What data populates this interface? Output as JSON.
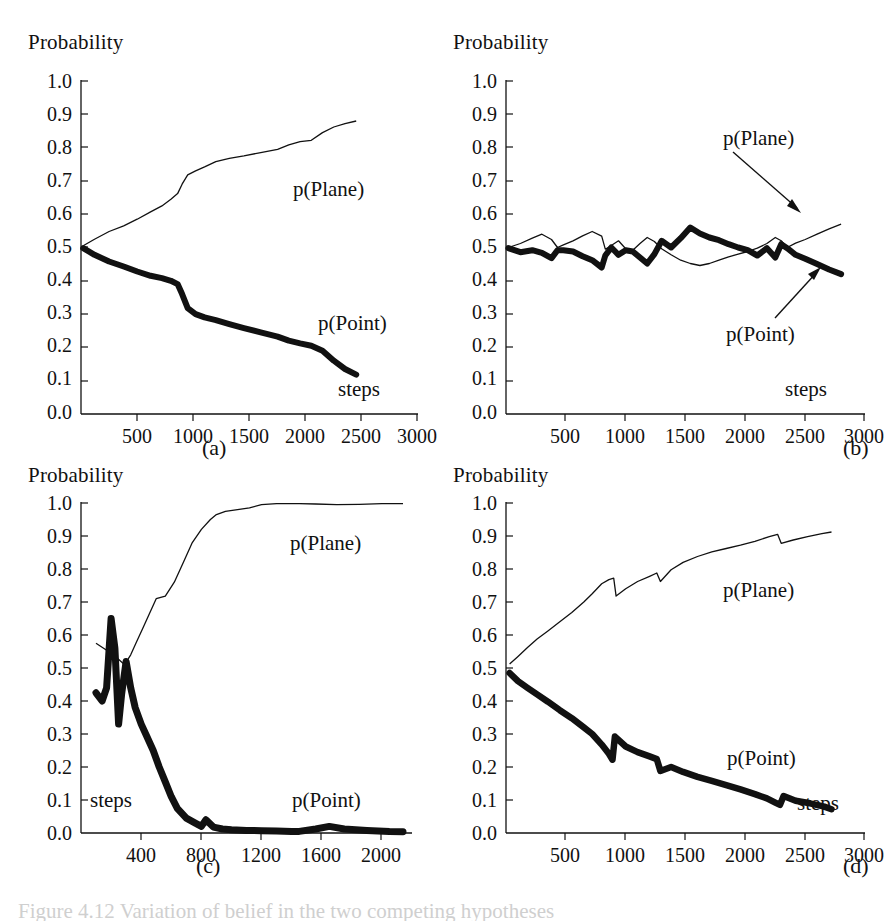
{
  "figure": {
    "panels": [
      {
        "id": "a",
        "letter": "(a)",
        "y_axis_title": "Probability",
        "x_axis_title": "steps",
        "labels": {
          "plane": "p(Plane)",
          "point": "p(Point)"
        },
        "y_ticks": [
          "0.0",
          "0.1",
          "0.2",
          "0.3",
          "0.4",
          "0.5",
          "0.6",
          "0.7",
          "0.8",
          "0.9",
          "1.0"
        ],
        "x_ticks": [
          "500",
          "1000",
          "1500",
          "2000",
          "2500",
          "3000"
        ],
        "has_arrows": false
      },
      {
        "id": "b",
        "letter": "(b)",
        "y_axis_title": "Probability",
        "x_axis_title": "steps",
        "labels": {
          "plane": "p(Plane)",
          "point": "p(Point)"
        },
        "y_ticks": [
          "0.0",
          "0.1",
          "0.2",
          "0.3",
          "0.4",
          "0.5",
          "0.6",
          "0.7",
          "0.8",
          "0.9",
          "1.0"
        ],
        "x_ticks": [
          "500",
          "1000",
          "1500",
          "2000",
          "2500",
          "3000"
        ],
        "has_arrows": true
      },
      {
        "id": "c",
        "letter": "(c)",
        "y_axis_title": "Probability",
        "x_axis_title": "steps",
        "labels": {
          "plane": "p(Plane)",
          "point": "p(Point)"
        },
        "y_ticks": [
          "0.0",
          "0.1",
          "0.2",
          "0.3",
          "0.4",
          "0.5",
          "0.6",
          "0.7",
          "0.8",
          "0.9",
          "1.0"
        ],
        "x_ticks": [
          "400",
          "800",
          "1200",
          "1600",
          "2000"
        ],
        "has_arrows": false
      },
      {
        "id": "d",
        "letter": "(d)",
        "y_axis_title": "Probability",
        "x_axis_title": "steps",
        "labels": {
          "plane": "p(Plane)",
          "point": "p(Point)"
        },
        "y_ticks": [
          "0.0",
          "0.1",
          "0.2",
          "0.3",
          "0.4",
          "0.5",
          "0.6",
          "0.7",
          "0.8",
          "0.9",
          "1.0"
        ],
        "x_ticks": [
          "500",
          "1000",
          "1500",
          "2000",
          "2500",
          "3000"
        ],
        "has_arrows": false
      }
    ],
    "caption": "Figure 4.12  Variation of belief in the two competing hypotheses"
  },
  "chart_data": [
    {
      "type": "line",
      "panel": "a",
      "title": "(a)",
      "xlabel": "steps",
      "ylabel": "Probability",
      "xlim": [
        0,
        3000
      ],
      "ylim": [
        0.0,
        1.0
      ],
      "xticks": [
        500,
        1000,
        1500,
        2000,
        2500,
        3000
      ],
      "yticks": [
        0.0,
        0.1,
        0.2,
        0.3,
        0.4,
        0.5,
        0.6,
        0.7,
        0.8,
        0.9,
        1.0
      ],
      "grid": false,
      "legend": "inline-annotations",
      "series": [
        {
          "name": "p(Plane)",
          "style": "thin",
          "x": [
            20,
            120,
            250,
            380,
            500,
            620,
            720,
            800,
            860,
            900,
            950,
            1020,
            1100,
            1200,
            1320,
            1450,
            1600,
            1750,
            1850,
            1950,
            2050,
            2150,
            2250,
            2350,
            2450
          ],
          "y": [
            0.505,
            0.525,
            0.548,
            0.565,
            0.585,
            0.607,
            0.625,
            0.645,
            0.662,
            0.69,
            0.718,
            0.73,
            0.742,
            0.758,
            0.768,
            0.775,
            0.785,
            0.795,
            0.808,
            0.818,
            0.822,
            0.845,
            0.862,
            0.872,
            0.88
          ]
        },
        {
          "name": "p(Point)",
          "style": "thick",
          "x": [
            20,
            120,
            250,
            380,
            500,
            620,
            720,
            800,
            860,
            900,
            950,
            1020,
            1100,
            1200,
            1320,
            1450,
            1600,
            1750,
            1850,
            1950,
            2050,
            2150,
            2250,
            2350,
            2450
          ],
          "y": [
            0.498,
            0.478,
            0.458,
            0.443,
            0.428,
            0.415,
            0.408,
            0.4,
            0.39,
            0.36,
            0.318,
            0.3,
            0.29,
            0.282,
            0.27,
            0.258,
            0.245,
            0.232,
            0.22,
            0.212,
            0.205,
            0.19,
            0.16,
            0.135,
            0.118
          ]
        }
      ]
    },
    {
      "type": "line",
      "panel": "b",
      "title": "(b)",
      "xlabel": "steps",
      "ylabel": "Probability",
      "xlim": [
        0,
        3000
      ],
      "ylim": [
        0.0,
        1.0
      ],
      "xticks": [
        500,
        1000,
        1500,
        2000,
        2500,
        3000
      ],
      "yticks": [
        0.0,
        0.1,
        0.2,
        0.3,
        0.4,
        0.5,
        0.6,
        0.7,
        0.8,
        0.9,
        1.0
      ],
      "grid": false,
      "legend": "arrow-annotations",
      "series": [
        {
          "name": "p(Plane)",
          "style": "thin",
          "x": [
            20,
            120,
            220,
            300,
            380,
            430,
            480,
            560,
            640,
            720,
            800,
            830,
            880,
            940,
            1000,
            1060,
            1120,
            1180,
            1240,
            1300,
            1380,
            1460,
            1540,
            1620,
            1700,
            1780,
            1860,
            1940,
            2020,
            2100,
            2180,
            2250,
            2300,
            2350,
            2420,
            2500,
            2600,
            2700,
            2800
          ],
          "y": [
            0.5,
            0.512,
            0.528,
            0.54,
            0.524,
            0.5,
            0.508,
            0.52,
            0.535,
            0.548,
            0.534,
            0.495,
            0.506,
            0.52,
            0.496,
            0.492,
            0.512,
            0.53,
            0.518,
            0.496,
            0.478,
            0.462,
            0.452,
            0.446,
            0.452,
            0.462,
            0.472,
            0.48,
            0.488,
            0.498,
            0.512,
            0.53,
            0.52,
            0.5,
            0.513,
            0.524,
            0.54,
            0.556,
            0.57
          ]
        },
        {
          "name": "p(Point)",
          "style": "thick",
          "x": [
            20,
            120,
            220,
            300,
            380,
            430,
            480,
            560,
            640,
            720,
            800,
            830,
            880,
            940,
            1000,
            1060,
            1120,
            1180,
            1240,
            1300,
            1380,
            1460,
            1540,
            1620,
            1700,
            1780,
            1860,
            1940,
            2020,
            2100,
            2180,
            2250,
            2300,
            2350,
            2420,
            2500,
            2600,
            2700,
            2800
          ],
          "y": [
            0.498,
            0.486,
            0.492,
            0.484,
            0.468,
            0.492,
            0.492,
            0.488,
            0.474,
            0.462,
            0.44,
            0.476,
            0.5,
            0.478,
            0.492,
            0.488,
            0.47,
            0.452,
            0.48,
            0.52,
            0.5,
            0.528,
            0.56,
            0.542,
            0.53,
            0.522,
            0.51,
            0.5,
            0.492,
            0.476,
            0.498,
            0.47,
            0.51,
            0.498,
            0.478,
            0.466,
            0.45,
            0.434,
            0.42
          ]
        }
      ],
      "annotations": [
        {
          "text": "p(Plane)",
          "points_to": [
            2620,
            0.555
          ]
        },
        {
          "text": "p(Point)",
          "points_to": [
            2700,
            0.43
          ]
        }
      ]
    },
    {
      "type": "line",
      "panel": "c",
      "title": "(c)",
      "xlabel": "steps",
      "ylabel": "Probability",
      "xlim": [
        0,
        2200
      ],
      "ylim": [
        0.0,
        1.0
      ],
      "xticks": [
        400,
        800,
        1200,
        1600,
        2000
      ],
      "yticks": [
        0.0,
        0.1,
        0.2,
        0.3,
        0.4,
        0.5,
        0.6,
        0.7,
        0.8,
        0.9,
        1.0
      ],
      "grid": false,
      "legend": "inline-annotations",
      "data_gap": [
        1450,
        1540
      ],
      "series": [
        {
          "name": "p(Plane)",
          "style": "thin",
          "x": [
            100,
            150,
            200,
            240,
            290,
            330,
            370,
            410,
            450,
            500,
            560,
            620,
            680,
            740,
            800,
            860,
            900,
            960,
            1040,
            1120,
            1200,
            1300,
            1400,
            1450,
            1560,
            1700,
            1850,
            2000,
            2140
          ],
          "y": [
            0.575,
            0.56,
            0.545,
            0.53,
            0.51,
            0.54,
            0.58,
            0.62,
            0.66,
            0.71,
            0.718,
            0.76,
            0.82,
            0.88,
            0.92,
            0.95,
            0.965,
            0.975,
            0.98,
            0.985,
            0.995,
            0.998,
            0.998,
            0.998,
            0.997,
            0.995,
            0.996,
            0.998,
            0.998
          ]
        },
        {
          "name": "p(Point)",
          "style": "thick",
          "x": [
            100,
            140,
            170,
            200,
            225,
            250,
            270,
            300,
            330,
            360,
            400,
            440,
            480,
            520,
            560,
            600,
            640,
            700,
            760,
            800,
            830,
            880,
            940,
            1000,
            1100,
            1200,
            1300,
            1400,
            1450,
            1560,
            1650,
            1750,
            1900,
            2050,
            2140
          ],
          "y": [
            0.425,
            0.4,
            0.44,
            0.65,
            0.56,
            0.33,
            0.42,
            0.52,
            0.44,
            0.38,
            0.33,
            0.29,
            0.25,
            0.2,
            0.155,
            0.11,
            0.075,
            0.045,
            0.03,
            0.02,
            0.04,
            0.018,
            0.012,
            0.01,
            0.008,
            0.007,
            0.006,
            0.005,
            0.005,
            0.012,
            0.02,
            0.012,
            0.008,
            0.005,
            0.004
          ]
        }
      ]
    },
    {
      "type": "line",
      "panel": "d",
      "title": "(d)",
      "xlabel": "steps",
      "ylabel": "Probability",
      "xlim": [
        0,
        3000
      ],
      "ylim": [
        0.0,
        1.0
      ],
      "xticks": [
        500,
        1000,
        1500,
        2000,
        2500,
        3000
      ],
      "yticks": [
        0.0,
        0.1,
        0.2,
        0.3,
        0.4,
        0.5,
        0.6,
        0.7,
        0.8,
        0.9,
        1.0
      ],
      "grid": false,
      "legend": "inline-annotations",
      "series": [
        {
          "name": "p(Plane)",
          "style": "thin",
          "x": [
            30,
            100,
            180,
            260,
            350,
            450,
            550,
            650,
            720,
            800,
            860,
            900,
            920,
            1000,
            1100,
            1200,
            1260,
            1290,
            1380,
            1480,
            1600,
            1720,
            1840,
            1960,
            2080,
            2200,
            2270,
            2300,
            2400,
            2520,
            2640,
            2720
          ],
          "y": [
            0.512,
            0.535,
            0.562,
            0.588,
            0.612,
            0.64,
            0.668,
            0.7,
            0.725,
            0.755,
            0.768,
            0.772,
            0.718,
            0.74,
            0.762,
            0.778,
            0.788,
            0.762,
            0.798,
            0.82,
            0.838,
            0.852,
            0.862,
            0.872,
            0.884,
            0.898,
            0.905,
            0.878,
            0.888,
            0.898,
            0.907,
            0.912
          ]
        },
        {
          "name": "p(Point)",
          "style": "thick",
          "x": [
            30,
            100,
            180,
            260,
            350,
            450,
            550,
            650,
            720,
            800,
            860,
            890,
            910,
            1000,
            1100,
            1200,
            1260,
            1290,
            1380,
            1480,
            1600,
            1720,
            1840,
            1960,
            2080,
            2180,
            2250,
            2290,
            2320,
            2420,
            2540,
            2660,
            2720
          ],
          "y": [
            0.485,
            0.46,
            0.44,
            0.42,
            0.398,
            0.372,
            0.348,
            0.32,
            0.3,
            0.268,
            0.24,
            0.222,
            0.292,
            0.262,
            0.245,
            0.232,
            0.224,
            0.188,
            0.2,
            0.185,
            0.17,
            0.158,
            0.145,
            0.132,
            0.118,
            0.105,
            0.092,
            0.085,
            0.112,
            0.098,
            0.09,
            0.08,
            0.072
          ]
        }
      ]
    }
  ]
}
